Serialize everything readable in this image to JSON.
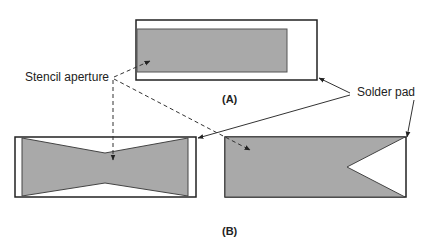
{
  "labels": {
    "stencil_aperture": "Stencil aperture",
    "solder_pad": "Solder pad",
    "panel_a": "(A)",
    "panel_b": "(B)"
  },
  "colors": {
    "aperture_fill": "#a9a9a9",
    "outline": "#222222",
    "background": "#ffffff"
  },
  "figures": [
    {
      "id": "A",
      "shape": "rectangular aperture inside rectangular pad"
    },
    {
      "id": "B-left",
      "shape": "bow-tie aperture inside rectangular pad"
    },
    {
      "id": "B-right",
      "shape": "rectangular aperture with V-notch inside rectangular pad"
    }
  ]
}
